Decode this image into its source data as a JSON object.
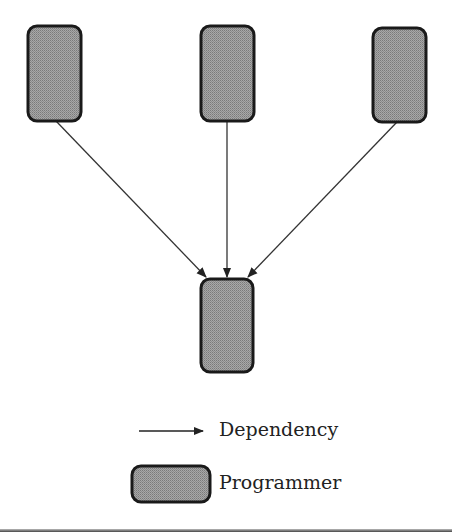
{
  "diagram": {
    "nodes": [
      {
        "id": "programmer-top-left",
        "type": "Programmer"
      },
      {
        "id": "programmer-top-middle",
        "type": "Programmer"
      },
      {
        "id": "programmer-top-right",
        "type": "Programmer"
      },
      {
        "id": "programmer-bottom",
        "type": "Programmer"
      }
    ],
    "edges": [
      {
        "from": "programmer-top-left",
        "to": "programmer-bottom",
        "type": "Dependency"
      },
      {
        "from": "programmer-top-middle",
        "to": "programmer-bottom",
        "type": "Dependency"
      },
      {
        "from": "programmer-top-right",
        "to": "programmer-bottom",
        "type": "Dependency"
      }
    ],
    "colors": {
      "node_fill": "#9a9a9a",
      "node_stroke": "#1a1a1a",
      "edge": "#333333"
    }
  },
  "legend": {
    "dependency_label": "Dependency",
    "programmer_label": "Programmer"
  }
}
